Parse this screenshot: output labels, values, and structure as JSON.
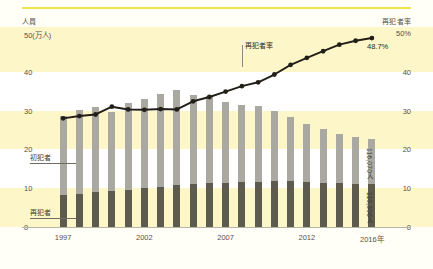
{
  "axis_titles": {
    "left": "人員",
    "right": "再犯者率"
  },
  "legend": {
    "first_offender": "初犯者",
    "repeat_offender": "再犯者"
  },
  "annotations": {
    "rate_line": "再犯者率",
    "end_rate_value": "48.7%",
    "total_end_label": "116,070人",
    "repeat_end_label": "110,306人"
  },
  "colors": {
    "band_yellow": "#fdf6c8",
    "band_white": "#ffffff",
    "bar_first_offender": "#a9a9a2",
    "bar_repeat_offender": "#5d5a4e",
    "line": "#221f18",
    "top_rule": "#f2e14a",
    "text": "#55524a"
  },
  "chart_data": {
    "type": "bar",
    "title": "",
    "subtitle": "",
    "xlabel": "",
    "ylabel": "人員",
    "y2label": "再犯者率",
    "grid": true,
    "legend_position": "inline-left",
    "x": [
      1997,
      1998,
      1999,
      2000,
      2001,
      2002,
      2003,
      2004,
      2005,
      2006,
      2007,
      2008,
      2009,
      2010,
      2011,
      2012,
      2013,
      2014,
      2015,
      2016
    ],
    "xtick_labels": [
      "1997",
      "2002",
      "2007",
      "2012",
      "2016年"
    ],
    "xtick_values": [
      1997,
      2002,
      2007,
      2012,
      2016
    ],
    "ylim": [
      0,
      50
    ],
    "yticks": [
      0,
      10,
      20,
      30,
      40,
      50
    ],
    "ytick_labels": [
      "0",
      "10",
      "20",
      "30",
      "40",
      "50(万人)"
    ],
    "y2lim": [
      0,
      50
    ],
    "y2ticks": [
      0,
      10,
      20,
      30,
      40,
      50
    ],
    "y2tick_labels": [
      "0",
      "10",
      "20",
      "30",
      "40",
      "50%"
    ],
    "stacked": true,
    "units": "万人",
    "series": [
      {
        "name": "再犯者",
        "type": "bar-segment",
        "stack_order": "bottom",
        "values": [
          8.3,
          8.6,
          8.9,
          9.2,
          9.6,
          10.0,
          10.4,
          10.7,
          11.0,
          11.3,
          11.4,
          11.5,
          11.6,
          11.8,
          11.8,
          11.6,
          11.4,
          11.3,
          11.1,
          11.0
        ]
      },
      {
        "name": "初犯者",
        "type": "bar-segment",
        "stack_order": "top",
        "values": [
          20.3,
          21.5,
          22.0,
          20.4,
          22.4,
          23.1,
          23.8,
          24.5,
          23.0,
          22.5,
          20.8,
          20.0,
          19.5,
          18.2,
          16.5,
          15.0,
          13.8,
          12.7,
          12.0,
          11.6
        ]
      },
      {
        "name": "再犯者率",
        "type": "line",
        "axis": "right",
        "values": [
          28.0,
          28.6,
          29.0,
          31.0,
          30.3,
          30.2,
          30.4,
          30.3,
          32.4,
          33.5,
          34.9,
          36.3,
          37.3,
          39.3,
          41.8,
          43.6,
          45.3,
          47.0,
          48.0,
          48.7
        ]
      }
    ],
    "totals": [
      28.6,
      30.1,
      30.9,
      29.6,
      32.0,
      33.1,
      34.2,
      35.2,
      34.0,
      33.8,
      32.2,
      31.5,
      31.1,
      30.0,
      28.3,
      26.6,
      25.2,
      24.0,
      23.1,
      22.6
    ],
    "annotations": [
      {
        "text": "48.7%",
        "x": 2016,
        "y": 48.7,
        "axis": "right"
      },
      {
        "text": "116,070人",
        "x": 2016,
        "note": "total persons 2016"
      },
      {
        "text": "110,306人",
        "x": 2016,
        "note": "repeat offenders 2016"
      }
    ]
  }
}
